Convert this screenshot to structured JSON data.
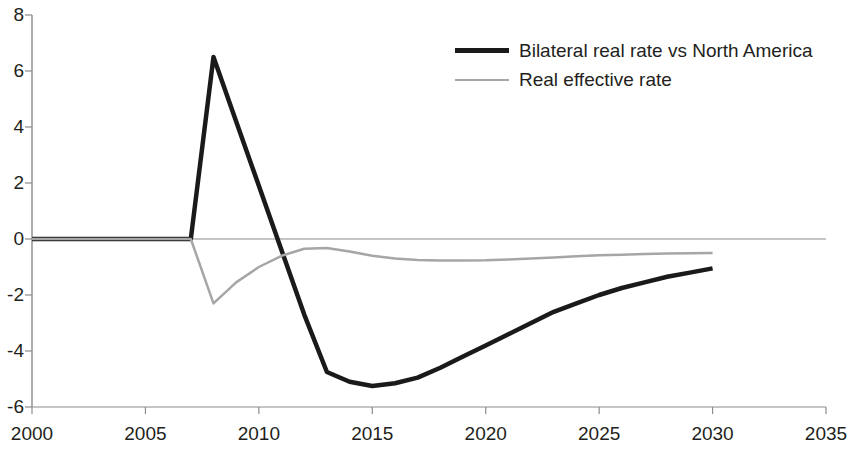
{
  "chart_data": {
    "type": "line",
    "title": "",
    "subtitle": "",
    "xlabel": "",
    "ylabel": "",
    "xlim": [
      2000,
      2035
    ],
    "ylim": [
      -6,
      8
    ],
    "grid": false,
    "legend_position": "top-right",
    "x_ticks": [
      "2000",
      "2005",
      "2010",
      "2015",
      "2020",
      "2025",
      "2030",
      "2035"
    ],
    "y_ticks": [
      "8",
      "6",
      "4",
      "2",
      "0",
      "-2",
      "-4",
      "-6"
    ],
    "zero_line": 0,
    "series": [
      {
        "name": "Bilateral real rate vs North America",
        "color": "#1a1a1a",
        "width": 4.5,
        "x": [
          2000,
          2001,
          2002,
          2003,
          2004,
          2005,
          2006,
          2007,
          2008,
          2009,
          2010,
          2011,
          2012,
          2013,
          2014,
          2015,
          2016,
          2017,
          2018,
          2019,
          2020,
          2021,
          2022,
          2023,
          2024,
          2025,
          2026,
          2027,
          2028,
          2029,
          2030
        ],
        "values": [
          0,
          0,
          0,
          0,
          0,
          0,
          0,
          0,
          6.5,
          4.2,
          1.9,
          -0.4,
          -2.7,
          -4.75,
          -5.1,
          -5.25,
          -5.15,
          -4.95,
          -4.6,
          -4.2,
          -3.8,
          -3.4,
          -3.0,
          -2.6,
          -2.3,
          -2.0,
          -1.75,
          -1.55,
          -1.35,
          -1.2,
          -1.05
        ]
      },
      {
        "name": "Real effective rate",
        "color": "#a6a6a6",
        "width": 2.5,
        "x": [
          2000,
          2001,
          2002,
          2003,
          2004,
          2005,
          2006,
          2007,
          2008,
          2009,
          2010,
          2011,
          2012,
          2013,
          2014,
          2015,
          2016,
          2017,
          2018,
          2019,
          2020,
          2021,
          2022,
          2023,
          2024,
          2025,
          2026,
          2027,
          2028,
          2029,
          2030
        ],
        "values": [
          0,
          0,
          0,
          0,
          0,
          0,
          0,
          0,
          -2.3,
          -1.55,
          -1.0,
          -0.6,
          -0.35,
          -0.32,
          -0.45,
          -0.6,
          -0.7,
          -0.75,
          -0.77,
          -0.77,
          -0.76,
          -0.73,
          -0.7,
          -0.66,
          -0.62,
          -0.58,
          -0.56,
          -0.54,
          -0.52,
          -0.51,
          -0.5
        ]
      }
    ]
  },
  "legend": {
    "items": [
      {
        "label": "Bilateral real rate vs North America",
        "swatch": "bilateral-line-swatch"
      },
      {
        "label": "Real effective rate",
        "swatch": "effective-line-swatch"
      }
    ]
  },
  "axes": {
    "y_labels": [
      "8",
      "6",
      "4",
      "2",
      "0",
      "-2",
      "-4",
      "-6"
    ],
    "x_labels": [
      "2000",
      "2005",
      "2010",
      "2015",
      "2020",
      "2025",
      "2030",
      "2035"
    ]
  },
  "colors": {
    "bilateral": "#1a1a1a",
    "effective": "#a6a6a6",
    "axis": "#8c8c8c",
    "text": "#231f20"
  }
}
